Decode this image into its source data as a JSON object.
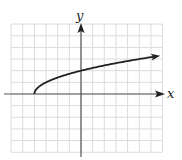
{
  "chart_data": {
    "type": "line",
    "title": "",
    "xlabel": "x",
    "ylabel": "y",
    "function": "y = sqrt(x + 4)",
    "xlim": [
      -6,
      7
    ],
    "ylim": [
      -5,
      6
    ],
    "grid": true,
    "series": [
      {
        "name": "curve",
        "start_point": [
          -4,
          0
        ],
        "arrow_end": true,
        "x": [
          -4,
          -3.75,
          -3.5,
          -3,
          -2,
          -1,
          0,
          1,
          2,
          3,
          4,
          5,
          6.3
        ],
        "y": [
          0,
          0.5,
          0.71,
          1,
          1.41,
          1.73,
          2,
          2.24,
          2.45,
          2.65,
          2.83,
          3,
          3.22
        ]
      }
    ],
    "colors": {
      "curve": "#222222",
      "axes": "#555555",
      "grid": "#dcdcdc"
    }
  },
  "labels": {
    "x_axis": "x",
    "y_axis": "y"
  }
}
